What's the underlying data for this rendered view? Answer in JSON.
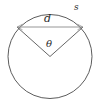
{
  "figure": {
    "background_color": "#ffffff",
    "stroke_color": "#4a4a4a",
    "chord_color": "#7a7a7a",
    "radius_color": "#555555",
    "width": 102,
    "height": 105
  },
  "labels": {
    "chord": "d",
    "arc": "s",
    "angle": "θ"
  },
  "geometry": {
    "circle": {
      "cx": 50,
      "cy": 56.5,
      "r": 42
    },
    "chord": {
      "x1": 17,
      "y1": 27,
      "x2": 83,
      "y2": 27
    },
    "radius_left": {
      "x1": 50,
      "y1": 56.5,
      "x2": 17,
      "y2": 27
    },
    "radius_right": {
      "x1": 50,
      "y1": 56.5,
      "x2": 83,
      "y2": 27
    },
    "arc_label_point": {
      "x": 77,
      "y": 9
    }
  }
}
